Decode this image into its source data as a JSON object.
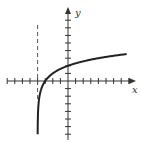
{
  "chart_data": {
    "type": "line",
    "title": "",
    "xlabel": "x",
    "ylabel": "y",
    "function": "y = log2(x + 4)",
    "asymptote": {
      "type": "vertical",
      "x": -4,
      "style": "dashed"
    },
    "x_intercept": -3,
    "y_intercept": 2,
    "xlim": [
      -8,
      9
    ],
    "ylim": [
      -7,
      9
    ],
    "tick_spacing": 1,
    "tick_labels": false,
    "grid": false,
    "legend": null,
    "series": [
      {
        "name": "curve",
        "x": [
          -3.99,
          -3.9,
          -3.75,
          -3.5,
          -3,
          -2,
          -1,
          0,
          2,
          4,
          6,
          8
        ],
        "values": [
          -6.6,
          -3.3,
          -2.0,
          -1.0,
          0,
          1,
          1.58,
          2,
          2.58,
          3,
          3.32,
          3.58
        ]
      }
    ]
  },
  "labels": {
    "x": "x",
    "y": "y"
  },
  "colors": {
    "axis": "#333333",
    "curve": "#222222",
    "asymptote": "#555555"
  }
}
